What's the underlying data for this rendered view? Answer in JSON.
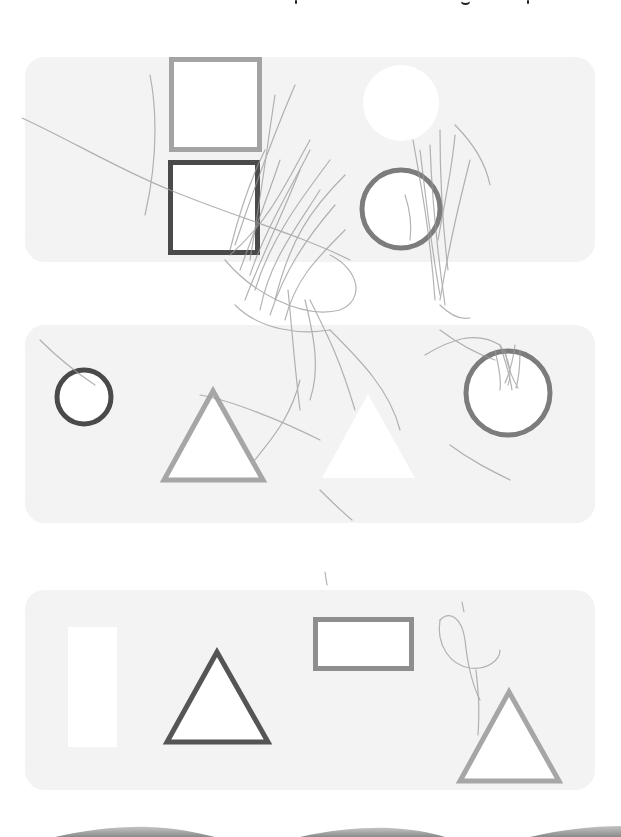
{
  "page": {
    "background": "#ffffff",
    "panel_color": "#f3f3f3",
    "title_fragment": {
      "note_visible": "only descenders of the cropped heading are visible"
    }
  },
  "colors": {
    "dark_outline": "#4a4a4a",
    "mid_outline": "#7c7c7c",
    "light_outline": "#a6a6a6",
    "rect_outline": "#8e8e8e",
    "scribble": "#9a9a9a",
    "wave": "#9c9c9c"
  },
  "panels": [
    {
      "id": "panel-1",
      "y": 57,
      "height": 205,
      "shapes": [
        {
          "type": "square-outline",
          "tone": "light",
          "x": 169,
          "y": 57,
          "w": 93,
          "h": 95,
          "stroke": 5
        },
        {
          "type": "square-outline",
          "tone": "dark",
          "x": 168,
          "y": 160,
          "w": 92,
          "h": 95,
          "stroke": 5
        },
        {
          "type": "circle-filled-white",
          "cx": 401,
          "cy": 103,
          "r": 38
        },
        {
          "type": "circle-outline",
          "tone": "mid",
          "cx": 401,
          "cy": 209,
          "r": 41,
          "stroke": 5
        }
      ]
    },
    {
      "id": "panel-2",
      "y": 325,
      "height": 198,
      "shapes": [
        {
          "type": "circle-outline",
          "tone": "dark",
          "cx": 84,
          "cy": 397,
          "r": 29,
          "stroke": 5
        },
        {
          "type": "triangle-outline",
          "tone": "light",
          "apex": [
            213,
            387
          ],
          "base_left": [
            160,
            482
          ],
          "base_right": [
            267,
            482
          ],
          "stroke": 5
        },
        {
          "type": "triangle-filled-white",
          "apex": [
            368,
            394
          ],
          "base_left": [
            322,
            478
          ],
          "base_right": [
            415,
            478
          ]
        },
        {
          "type": "circle-outline",
          "tone": "mid",
          "cx": 508,
          "cy": 393,
          "r": 44,
          "stroke": 5
        }
      ]
    },
    {
      "id": "panel-3",
      "y": 590,
      "height": 200,
      "shapes": [
        {
          "type": "rect-filled-white",
          "x": 68,
          "y": 627,
          "w": 49,
          "h": 120
        },
        {
          "type": "triangle-outline",
          "tone": "dark",
          "apex": [
            217,
            648
          ],
          "base_left": [
            163,
            744
          ],
          "base_right": [
            272,
            744
          ],
          "stroke": 5
        },
        {
          "type": "rect-outline",
          "tone": "rect",
          "x": 313,
          "y": 617,
          "w": 101,
          "h": 54,
          "stroke": 5
        },
        {
          "type": "triangle-outline",
          "tone": "light",
          "apex": [
            509,
            688
          ],
          "base_left": [
            456,
            783
          ],
          "base_right": [
            563,
            783
          ],
          "stroke": 5
        }
      ]
    }
  ],
  "footer_waves": {
    "count": 3
  }
}
